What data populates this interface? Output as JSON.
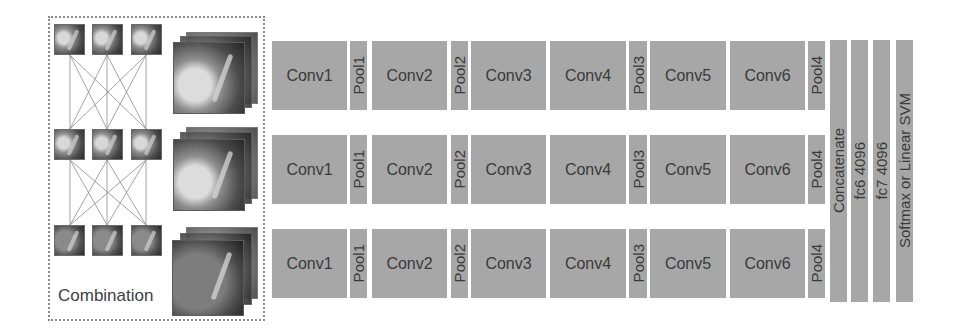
{
  "combination": {
    "label": "Combination",
    "patch_rows": 3,
    "patch_cols": 3,
    "stacks": 3
  },
  "streams": [
    {
      "layers": [
        "Conv1",
        "Pool1",
        "Conv2",
        "Pool2",
        "Conv3",
        "Conv4",
        "Pool3",
        "Conv5",
        "Conv6",
        "Pool4"
      ]
    },
    {
      "layers": [
        "Conv1",
        "Pool1",
        "Conv2",
        "Pool2",
        "Conv3",
        "Conv4",
        "Pool3",
        "Conv5",
        "Conv6",
        "Pool4"
      ]
    },
    {
      "layers": [
        "Conv1",
        "Pool1",
        "Conv2",
        "Pool2",
        "Conv3",
        "Conv4",
        "Pool3",
        "Conv5",
        "Conv6",
        "Pool4"
      ]
    }
  ],
  "head": {
    "concat": "Concatenate",
    "fc6": "fc6 4096",
    "fc7": "fc7 4096",
    "classifier": "Softmax or Linear SVM"
  },
  "colors": {
    "block": "#a7a7a7",
    "text": "#3a3a3a",
    "border_dotted": "#8a8a8a"
  }
}
